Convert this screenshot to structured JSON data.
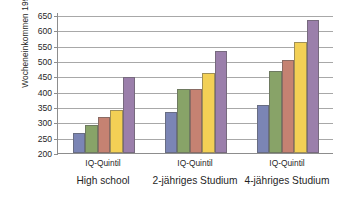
{
  "chart_data": {
    "type": "bar",
    "title": "",
    "subtitle": "",
    "xlabel": "",
    "ylabel": "Wocheneinkommen 1992 in Dollar",
    "ylim": [
      200,
      660
    ],
    "ytick_values": [
      200,
      250,
      300,
      350,
      400,
      450,
      500,
      550,
      600,
      650
    ],
    "ytick_labels": [
      "200",
      "250",
      "300",
      "350",
      "400",
      "450",
      "500",
      "550",
      "600",
      "650"
    ],
    "grid": true,
    "legend": false,
    "legend_position": "none",
    "categories": [
      "High school",
      "2-jähriges Studium",
      "4-jähriges Studium"
    ],
    "group_sublabels": [
      "IQ-Quintil",
      "IQ-Quintil",
      "IQ-Quintil"
    ],
    "series": [
      {
        "name": "1. Quintil",
        "color": "#7b85b5",
        "values": [
          265,
          335,
          358
        ]
      },
      {
        "name": "2. Quintil",
        "color": "#88a368",
        "values": [
          293,
          408,
          467
        ]
      },
      {
        "name": "3. Quintil",
        "color": "#c58272",
        "values": [
          318,
          408,
          505
        ]
      },
      {
        "name": "4. Quintil",
        "color": "#f3d055",
        "values": [
          340,
          460,
          562
        ]
      },
      {
        "name": "5. Quintil",
        "color": "#9b7fab",
        "values": [
          448,
          533,
          633
        ]
      }
    ],
    "axis_color": "#8d8d8d",
    "grid_color": "#a8a8a8",
    "background": "#ffffff"
  }
}
